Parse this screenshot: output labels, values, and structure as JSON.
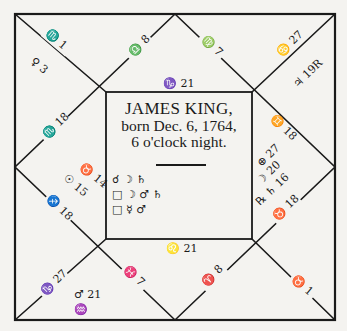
{
  "chart": {
    "title": {
      "name": "JAMES KING,",
      "born": "born Dec. 6, 1764,",
      "time": "6 o'clock night."
    },
    "aspects": [
      {
        "aspect": "☌",
        "bodies": "☽ ♄",
        "text": "☌ ☽ ♄"
      },
      {
        "aspect": "□",
        "bodies": "☽ ♂ ♄",
        "text": "□ ☽ ♂ ♄"
      },
      {
        "aspect": "□",
        "bodies": "☿ ♂",
        "text": "□ ☿ ♂"
      }
    ],
    "cusps": {
      "top_left_outer": "♏ 1",
      "top_mid_left": "♎ 8",
      "top_mid_right": "♍ 7",
      "top_right_outer": "♋ 27",
      "top_center": "♑ 21",
      "right_upper": "♊ 18",
      "right_lower": "♉ 18",
      "bottom_right_outer": "♉ 1",
      "bottom_mid_right": "♈ 8",
      "bottom_mid_left": "♓ 7",
      "bottom_center": "♌ 21",
      "bottom_left_outer": "♑ 27",
      "left_upper": "♏ 18",
      "left_lower": "♐ 18"
    },
    "planets": {
      "top_left_house": "♀ 3",
      "top_right_house": "♃ 19R",
      "right_house": [
        "⊕ 27",
        "☽ 20",
        "℞ ♄ 16"
      ],
      "left_house": [
        "♉ 14",
        "☉ 15"
      ],
      "bottom_left_house": [
        "♂ 21",
        "♒"
      ]
    }
  }
}
